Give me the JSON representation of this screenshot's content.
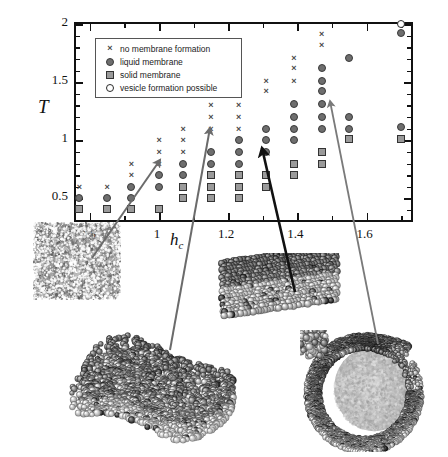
{
  "figure": {
    "title": "",
    "axes": {
      "xlabel": "h",
      "xlabel_sub": "c",
      "ylabel": "T",
      "xlim": [
        0.76,
        1.74
      ],
      "ylim": [
        0.28,
        2.0
      ],
      "xticks_major": [
        0.8,
        1.0,
        1.2,
        1.4,
        1.6
      ],
      "xticks_major_labels": [
        "0.8",
        "1",
        "1.2",
        "1.4",
        "1.6"
      ],
      "xticks_minor": [
        0.9,
        1.1,
        1.3,
        1.5,
        1.7
      ],
      "yticks_major": [
        0.5,
        1.0,
        1.5,
        2.0
      ],
      "yticks_major_labels": [
        "0.5",
        "1",
        "1.5",
        "2"
      ],
      "yticks_minor": [
        0.4,
        0.6,
        0.7,
        0.8,
        0.9,
        1.1,
        1.2,
        1.3,
        1.4,
        1.6,
        1.7,
        1.8,
        1.9
      ]
    },
    "legend": {
      "position": "top-left-inside",
      "entries": [
        {
          "symbol": "cross",
          "label": "no membrane formation"
        },
        {
          "symbol": "filled-circle",
          "label": "liquid membrane"
        },
        {
          "symbol": "filled-square",
          "label": "solid membrane"
        },
        {
          "symbol": "open-circle",
          "label": "vesicle formation possible"
        }
      ]
    }
  },
  "chart_data": {
    "type": "scatter",
    "title": "",
    "xlabel": "h_c",
    "ylabel": "T",
    "xlim": [
      0.76,
      1.74
    ],
    "ylim": [
      0.28,
      2.0
    ],
    "grid": false,
    "legend_position": "upper left (inset box)",
    "categories": [
      "no membrane formation",
      "liquid membrane",
      "solid membrane",
      "vesicle formation possible"
    ],
    "series": [
      {
        "name": "no membrane formation",
        "symbol": "cross",
        "points": [
          [
            0.77,
            0.6
          ],
          [
            0.85,
            0.6
          ],
          [
            0.92,
            0.7
          ],
          [
            0.92,
            0.8
          ],
          [
            1.0,
            0.8
          ],
          [
            1.0,
            0.9
          ],
          [
            1.0,
            1.0
          ],
          [
            1.07,
            0.9
          ],
          [
            1.07,
            1.0
          ],
          [
            1.07,
            1.1
          ],
          [
            1.15,
            1.1
          ],
          [
            1.15,
            1.2
          ],
          [
            1.15,
            1.3
          ],
          [
            1.23,
            1.1
          ],
          [
            1.23,
            1.2
          ],
          [
            1.23,
            1.3
          ],
          [
            1.23,
            1.42
          ],
          [
            1.31,
            1.42
          ],
          [
            1.31,
            1.51
          ],
          [
            1.39,
            1.51
          ],
          [
            1.39,
            1.62
          ],
          [
            1.39,
            1.71
          ],
          [
            1.47,
            1.82
          ],
          [
            1.47,
            1.91
          ]
        ]
      },
      {
        "name": "liquid membrane",
        "symbol": "filled-circle",
        "points": [
          [
            0.77,
            0.5
          ],
          [
            0.85,
            0.5
          ],
          [
            0.92,
            0.5
          ],
          [
            0.92,
            0.6
          ],
          [
            1.0,
            0.6
          ],
          [
            1.0,
            0.7
          ],
          [
            1.07,
            0.7
          ],
          [
            1.07,
            0.8
          ],
          [
            1.15,
            0.8
          ],
          [
            1.15,
            0.9
          ],
          [
            1.23,
            0.8
          ],
          [
            1.23,
            0.9
          ],
          [
            1.23,
            1.0
          ],
          [
            1.31,
            0.9
          ],
          [
            1.31,
            1.0
          ],
          [
            1.31,
            1.1
          ],
          [
            1.39,
            1.0
          ],
          [
            1.39,
            1.1
          ],
          [
            1.39,
            1.2
          ],
          [
            1.39,
            1.31
          ],
          [
            1.47,
            1.1
          ],
          [
            1.47,
            1.2
          ],
          [
            1.47,
            1.31
          ],
          [
            1.47,
            1.42
          ],
          [
            1.47,
            1.51
          ],
          [
            1.47,
            1.62
          ],
          [
            1.55,
            1.1
          ],
          [
            1.55,
            1.2
          ],
          [
            1.55,
            1.71
          ],
          [
            1.7,
            1.11
          ],
          [
            1.7,
            1.92
          ]
        ]
      },
      {
        "name": "solid membrane",
        "symbol": "filled-square",
        "points": [
          [
            0.77,
            0.41
          ],
          [
            0.85,
            0.41
          ],
          [
            0.92,
            0.41
          ],
          [
            1.0,
            0.41
          ],
          [
            1.07,
            0.5
          ],
          [
            1.07,
            0.6
          ],
          [
            1.15,
            0.5
          ],
          [
            1.15,
            0.6
          ],
          [
            1.15,
            0.7
          ],
          [
            1.23,
            0.5
          ],
          [
            1.23,
            0.6
          ],
          [
            1.23,
            0.7
          ],
          [
            1.31,
            0.6
          ],
          [
            1.31,
            0.7
          ],
          [
            1.39,
            0.7
          ],
          [
            1.39,
            0.8
          ],
          [
            1.47,
            0.8
          ],
          [
            1.47,
            0.9
          ],
          [
            1.55,
            1.01
          ],
          [
            1.7,
            1.01
          ]
        ]
      },
      {
        "name": "vesicle formation possible",
        "symbol": "open-circle",
        "points": [
          [
            1.7,
            2.0
          ]
        ]
      }
    ]
  },
  "annotations": {
    "arrows": [
      {
        "name": "arrow-to-gas",
        "from": [
          92,
          258
        ],
        "to": [
          160,
          160
        ],
        "color": "#6b6b6b",
        "width": 2.0
      },
      {
        "name": "arrow-to-liquid",
        "from": [
          170,
          350
        ],
        "to": [
          210,
          128
        ],
        "color": "#6b6b6b",
        "width": 2.0
      },
      {
        "name": "arrow-to-solid",
        "from": [
          295,
          292
        ],
        "to": [
          262,
          148
        ],
        "color": "#111111",
        "width": 2.6
      },
      {
        "name": "arrow-to-vesicle",
        "from": [
          378,
          344
        ],
        "to": [
          330,
          101
        ],
        "color": "#7a7a7a",
        "width": 1.8
      }
    ],
    "snapshots": [
      {
        "name": "snapshot-gas",
        "description": "disordered gas of surfactant molecules"
      },
      {
        "name": "snapshot-liquid",
        "description": "fluctuating liquid membrane patch"
      },
      {
        "name": "snapshot-solid",
        "description": "flat ordered solid membrane"
      },
      {
        "name": "snapshot-vesicle",
        "description": "closing vesicle / cup-shaped aggregate"
      }
    ]
  },
  "colors": {
    "axis": "#111111",
    "cross": "#4a4a4a",
    "circle_fill": "#6e6e6e",
    "square_fill": "#9a9a9a",
    "arrow_gray": "#6b6b6b",
    "arrow_black": "#111111",
    "background": "#ffffff"
  }
}
